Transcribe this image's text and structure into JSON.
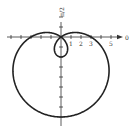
{
  "chart_data": {
    "type": "line",
    "title": "",
    "subtitle": "Polar graph: limaçon with inner loop",
    "equation": "r = 3 - 5 sin θ",
    "coordinate_system": "polar",
    "params": {
      "a": 3,
      "b": -5,
      "trig": "sin"
    },
    "xlabel": "0",
    "ylabel": "π/2",
    "x_tick_labels": [
      "1",
      "2",
      "3",
      "5"
    ],
    "x_ticks": [
      -5,
      -4,
      -3,
      -2,
      -1,
      1,
      2,
      3,
      4,
      5
    ],
    "y_ticks": [
      -8,
      -7,
      -6,
      -5,
      -4,
      -3,
      -2,
      -1,
      1,
      2
    ],
    "xlim": [
      -5.5,
      6
    ],
    "ylim": [
      -8.3,
      3.5
    ],
    "grid": false,
    "legend": null,
    "key_points": [
      {
        "theta": "0",
        "r": 3,
        "x": 3,
        "y": 0
      },
      {
        "theta": "π/2",
        "r": -2,
        "x": 0,
        "y": -2
      },
      {
        "theta": "π",
        "r": 3,
        "x": -3,
        "y": 0
      },
      {
        "theta": "3π/2",
        "r": 8,
        "x": 0,
        "y": -8
      }
    ]
  },
  "labels": {
    "polar_axis": "0",
    "vertical_axis": "π/2",
    "tick_1": "1",
    "tick_2": "2",
    "tick_3": "3",
    "tick_5": "5"
  },
  "colors": {
    "curve": "#222222",
    "axis": "#333333",
    "background": "#ffffff"
  }
}
